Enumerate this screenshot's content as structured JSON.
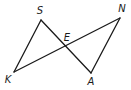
{
  "diagram": {
    "type": "geometry",
    "points": {
      "S": {
        "x": 41,
        "y": 20,
        "label": "S",
        "lx": 40,
        "ly": 14
      },
      "N": {
        "x": 120,
        "y": 18,
        "label": "N",
        "lx": 122,
        "ly": 12
      },
      "K": {
        "x": 14,
        "y": 72,
        "label": "K",
        "lx": 8,
        "ly": 83
      },
      "A": {
        "x": 91,
        "y": 73,
        "label": "A",
        "lx": 91,
        "ly": 85
      },
      "E": {
        "x": 67,
        "y": 46,
        "label": "E",
        "lx": 67,
        "ly": 41
      }
    },
    "segments": [
      {
        "from": "S",
        "to": "K"
      },
      {
        "from": "S",
        "to": "A"
      },
      {
        "from": "K",
        "to": "N"
      },
      {
        "from": "N",
        "to": "A"
      }
    ],
    "stroke_color": "#1a1a1a"
  }
}
